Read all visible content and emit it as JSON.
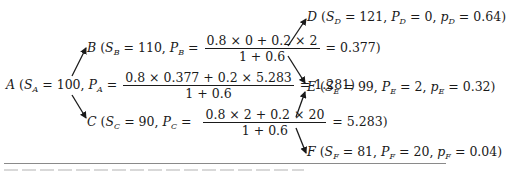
{
  "diagram": {
    "type": "binomial-tree",
    "nodes": {
      "A": {
        "label": "A",
        "S_sub": "A",
        "S_value": "100",
        "P_sub": "A",
        "num": "0.8 × 0.377 + 0.2 × 5.283",
        "den": "1 + 0.6",
        "result": "1.281"
      },
      "B": {
        "label": "B",
        "S_sub": "B",
        "S_value": "110",
        "P_sub": "B",
        "num": "0.8 × 0 + 0.2 × 2",
        "den": "1 + 0.6",
        "result": "0.377"
      },
      "C": {
        "label": "C",
        "S_sub": "C",
        "S_value": "90",
        "P_sub": "C",
        "num": "0.8 × 2 + 0.2 × 20",
        "den": "1 + 0.6",
        "result": "5.283"
      },
      "D": {
        "label": "D",
        "S_sub": "D",
        "S_value": "121",
        "P_sub": "D",
        "P_value": "0",
        "p_sub": "D",
        "p_value": "0.64"
      },
      "E": {
        "label": "E",
        "S_sub": "E",
        "S_value": "99",
        "P_sub": "E",
        "P_value": "2",
        "p_sub": "E",
        "p_value": "0.32"
      },
      "F": {
        "label": "F",
        "S_sub": "F",
        "S_value": "81",
        "P_sub": "F",
        "P_value": "20",
        "p_sub": "F",
        "p_value": "0.04"
      }
    },
    "edges": [
      {
        "from": "A",
        "to": "B"
      },
      {
        "from": "A",
        "to": "C"
      },
      {
        "from": "B",
        "to": "D"
      },
      {
        "from": "B",
        "to": "E"
      },
      {
        "from": "C",
        "to": "E"
      },
      {
        "from": "C",
        "to": "F"
      }
    ],
    "symbols": {
      "S": "S",
      "P": "P",
      "p": "p",
      "eq": "=",
      "open": "(",
      "close": ")",
      "comma": ","
    }
  }
}
